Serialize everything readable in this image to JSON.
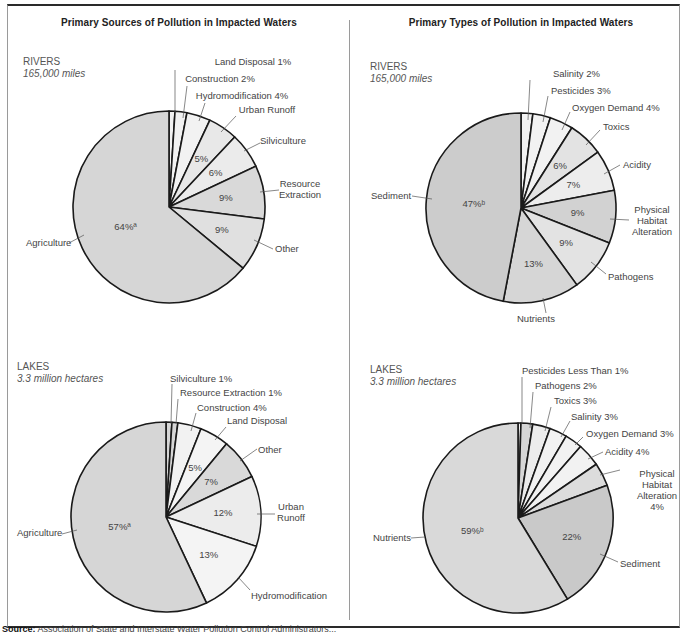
{
  "left_panel": {
    "title": "Primary Sources of Pollution in Impacted Waters"
  },
  "right_panel": {
    "title": "Primary Types of Pollution in Impacted Waters"
  },
  "source": {
    "label": "Source:",
    "text": "Association of State and Interstate Water Pollution Control Administrators..."
  },
  "colors": {
    "outline": "#1a1a1a",
    "text": "#444444",
    "light": "#f2f2f2",
    "mid": "#e2e2e2",
    "dark": "#d2d2d2",
    "darker": "#c6c6c6"
  },
  "chart_data": [
    {
      "type": "pie",
      "id": "rivers-sources",
      "title": "Primary Sources of Pollution in Impacted Waters",
      "heading": "RIVERS",
      "measure": "165,000 miles",
      "center": [
        169,
        207
      ],
      "radius": 96,
      "slices": [
        {
          "label": "Land Disposal 1%",
          "value": 1,
          "fill": "#f2f2f2",
          "inner": "",
          "lx": 253,
          "ly": 65,
          "anchor": "middle",
          "tick": [
            [
              175,
              113
            ],
            [
              175,
              70
            ]
          ]
        },
        {
          "label": "Construction 2%",
          "value": 2,
          "fill": "#f2f2f2",
          "inner": "",
          "lx": 220,
          "ly": 82,
          "anchor": "middle",
          "tick": [
            [
              183,
              118
            ],
            [
              187,
              86
            ]
          ]
        },
        {
          "label": "Hydromodification 4%",
          "value": 4,
          "fill": "#f2f2f2",
          "inner": "",
          "lx": 242,
          "ly": 99,
          "anchor": "middle",
          "tick": [
            [
              199,
              121
            ],
            [
              205,
              103
            ]
          ]
        },
        {
          "label": "Urban Runoff",
          "value": 5,
          "fill": "#e8e8e8",
          "inner": "5%",
          "lx": 267,
          "ly": 113,
          "anchor": "middle",
          "tick": [
            [
              221,
              132
            ],
            [
              236,
              116
            ]
          ]
        },
        {
          "label": "Silviculture",
          "value": 6,
          "fill": "#ebebeb",
          "inner": "6%",
          "lx": 283,
          "ly": 144,
          "anchor": "middle",
          "tick": [
            [
              244,
              151
            ],
            [
              260,
              143
            ]
          ]
        },
        {
          "label": "Resource\nExtraction",
          "value": 9,
          "fill": "#d9d9d9",
          "inner": "9%",
          "lx": 300,
          "ly": 187,
          "anchor": "middle",
          "tick": [
            [
              260,
              192
            ],
            [
              279,
              190
            ]
          ]
        },
        {
          "label": "Other",
          "value": 9,
          "fill": "#e0e0e0",
          "inner": "9%",
          "lx": 275,
          "ly": 252,
          "anchor": "start",
          "tick": [
            [
              254,
              240
            ],
            [
              273,
              249
            ]
          ]
        },
        {
          "label": "Agriculture",
          "value": 64,
          "fill": "#d6d6d6",
          "inner": "64%ª",
          "lx": 26,
          "ly": 246,
          "anchor": "start",
          "tick": [
            [
              84,
              235
            ],
            [
              69,
              243
            ]
          ]
        }
      ]
    },
    {
      "type": "pie",
      "id": "rivers-types",
      "title": "Primary Types of Pollution in Impacted Waters",
      "heading": "RIVERS",
      "measure": "165,000 miles",
      "center": [
        521,
        208
      ],
      "radius": 95,
      "slices": [
        {
          "label": "Salinity 2%",
          "value": 2,
          "fill": "#f2f2f2",
          "inner": "",
          "lx": 553,
          "ly": 77,
          "anchor": "start",
          "tick": [
            [
              528,
              120
            ],
            [
              530,
              80
            ]
          ]
        },
        {
          "label": "Pesticides 3%",
          "value": 3,
          "fill": "#f2f2f2",
          "inner": "",
          "lx": 551,
          "ly": 94,
          "anchor": "start",
          "tick": [
            [
              543,
              122
            ],
            [
              548,
              96
            ]
          ]
        },
        {
          "label": "Oxygen Demand 4%",
          "value": 4,
          "fill": "#f2f2f2",
          "inner": "",
          "lx": 572,
          "ly": 111,
          "anchor": "start",
          "tick": [
            [
              562,
              130
            ],
            [
              570,
              112
            ]
          ]
        },
        {
          "label": "Toxics",
          "value": 6,
          "fill": "#e3e3e3",
          "inner": "6%",
          "lx": 603,
          "ly": 130,
          "anchor": "start",
          "tick": [
            [
              586,
              145
            ],
            [
              600,
              130
            ]
          ]
        },
        {
          "label": "Acidity",
          "value": 7,
          "fill": "#ededed",
          "inner": "7%",
          "lx": 623,
          "ly": 168,
          "anchor": "start",
          "tick": [
            [
              604,
              174
            ],
            [
              620,
              165
            ]
          ]
        },
        {
          "label": "Physical\nHabitat\nAlteration",
          "value": 9,
          "fill": "#d2d2d2",
          "inner": "9%",
          "lx": 652,
          "ly": 213,
          "anchor": "middle",
          "tick": [
            [
              610,
              219
            ],
            [
              629,
              220
            ]
          ]
        },
        {
          "label": "Pathogens",
          "value": 9,
          "fill": "#e3e3e3",
          "inner": "9%",
          "lx": 608,
          "ly": 280,
          "anchor": "start",
          "tick": [
            [
              591,
              262
            ],
            [
              606,
              274
            ]
          ]
        },
        {
          "label": "Nutrients",
          "value": 13,
          "fill": "#d6d6d6",
          "inner": "13%",
          "lx": 536,
          "ly": 322,
          "anchor": "middle",
          "tick": [
            [
              543,
              298
            ],
            [
              546,
              313
            ]
          ]
        },
        {
          "label": "Sediment",
          "value": 47,
          "fill": "#cccccc",
          "inner": "47%ᵇ",
          "lx": 371,
          "ly": 199,
          "anchor": "start",
          "tick": [
            [
              432,
              199
            ],
            [
              412,
              196
            ]
          ]
        }
      ]
    },
    {
      "type": "pie",
      "id": "lakes-sources",
      "title": "Primary Sources of Pollution in Impacted Waters",
      "heading": "LAKES",
      "measure": "3.3 million hectares",
      "center": [
        166,
        517
      ],
      "radius": 95,
      "slices": [
        {
          "label": "Silviculture 1%",
          "value": 1,
          "fill": "#d6d6d6",
          "inner": "",
          "lx": 170,
          "ly": 382,
          "anchor": "start",
          "tick": [
            [
              171,
              424
            ],
            [
              172,
              384
            ]
          ]
        },
        {
          "label": "Resource Extraction 1%",
          "value": 1,
          "fill": "#d6d6d6",
          "inner": "",
          "lx": 180,
          "ly": 396,
          "anchor": "start",
          "tick": [
            [
              176,
              424
            ],
            [
              178,
              399
            ]
          ]
        },
        {
          "label": "Construction 4%",
          "value": 4,
          "fill": "#f2f2f2",
          "inner": "",
          "lx": 197,
          "ly": 411,
          "anchor": "start",
          "tick": [
            [
              191,
              431
            ],
            [
              196,
              413
            ]
          ]
        },
        {
          "label": "Land Disposal",
          "value": 5,
          "fill": "#f4f4f4",
          "inner": "5%",
          "lx": 227,
          "ly": 424,
          "anchor": "start",
          "tick": [
            [
              215,
              440
            ],
            [
              226,
              427
            ]
          ]
        },
        {
          "label": "Other",
          "value": 7,
          "fill": "#d9d9d9",
          "inner": "7%",
          "lx": 258,
          "ly": 453,
          "anchor": "start",
          "tick": [
            [
              240,
              461
            ],
            [
              257,
              449
            ]
          ]
        },
        {
          "label": "Urban\nRunoff",
          "value": 12,
          "fill": "#ececec",
          "inner": "12%",
          "lx": 291,
          "ly": 510,
          "anchor": "middle",
          "tick": [
            [
              257,
              514
            ],
            [
              275,
              514
            ]
          ]
        },
        {
          "label": "Hydromodification",
          "value": 13,
          "fill": "#f4f4f4",
          "inner": "13%",
          "lx": 251,
          "ly": 599,
          "anchor": "start",
          "tick": [
            [
              238,
              577
            ],
            [
              250,
              590
            ]
          ]
        },
        {
          "label": "Agriculture",
          "value": 57,
          "fill": "#d6d6d6",
          "inner": "57%ª",
          "lx": 17,
          "ly": 536,
          "anchor": "start",
          "tick": [
            [
              77,
              530
            ],
            [
              62,
              534
            ]
          ]
        }
      ]
    },
    {
      "type": "pie",
      "id": "lakes-types",
      "title": "Primary Types of Pollution in Impacted Waters",
      "heading": "LAKES",
      "measure": "3.3 million hectares",
      "center": [
        518,
        518
      ],
      "radius": 95,
      "slices": [
        {
          "label": "Pesticides Less Than 1%",
          "value": 0.5,
          "fill": "#f2f2f2",
          "inner": "",
          "lx": 522,
          "ly": 374,
          "anchor": "start",
          "tick": [
            [
              522,
              424
            ],
            [
              522,
              377
            ]
          ]
        },
        {
          "label": "Pathogens 2%",
          "value": 2,
          "fill": "#d6d6d6",
          "inner": "",
          "lx": 535,
          "ly": 389,
          "anchor": "start",
          "tick": [
            [
              530,
              428
            ],
            [
              533,
              392
            ]
          ]
        },
        {
          "label": "Toxics 3%",
          "value": 3,
          "fill": "#ececec",
          "inner": "",
          "lx": 554,
          "ly": 404,
          "anchor": "start",
          "tick": [
            [
              545,
              431
            ],
            [
              551,
              407
            ]
          ]
        },
        {
          "label": "Salinity 3%",
          "value": 3,
          "fill": "#f2f2f2",
          "inner": "",
          "lx": 571,
          "ly": 420,
          "anchor": "start",
          "tick": [
            [
              561,
              437
            ],
            [
              570,
              421
            ]
          ]
        },
        {
          "label": "Oxygen Demand 3%",
          "value": 3,
          "fill": "#f2f2f2",
          "inner": "",
          "lx": 586,
          "ly": 437,
          "anchor": "start",
          "tick": [
            [
              575,
              445
            ],
            [
              583,
              437
            ]
          ]
        },
        {
          "label": "Acidity 4%",
          "value": 4,
          "fill": "#f2f2f2",
          "inner": "",
          "lx": 605,
          "ly": 455,
          "anchor": "start",
          "tick": [
            [
              588,
              459
            ],
            [
              603,
              452
            ]
          ]
        },
        {
          "label": "Physical\nHabitat\nAlteration\n4%",
          "value": 4,
          "fill": "#dcdcdc",
          "inner": "",
          "lx": 657,
          "ly": 477,
          "anchor": "middle",
          "tick": [
            [
              600,
              475
            ],
            [
              620,
              470
            ]
          ]
        },
        {
          "label": "Sediment",
          "value": 22,
          "fill": "#c9c9c9",
          "inner": "22%",
          "lx": 620,
          "ly": 567,
          "anchor": "start",
          "tick": [
            [
              600,
              554
            ],
            [
              618,
              562
            ]
          ]
        },
        {
          "label": "Nutrients",
          "value": 59,
          "fill": "#d9d9d9",
          "inner": "59%ᵇ",
          "lx": 373,
          "ly": 541,
          "anchor": "start",
          "tick": [
            [
              425,
              537
            ],
            [
              411,
              538
            ]
          ]
        }
      ]
    }
  ]
}
